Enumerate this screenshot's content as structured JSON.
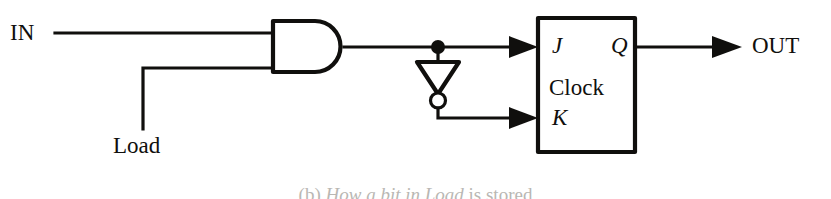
{
  "figure": {
    "background_color": "#ffffff",
    "ink_color": "#100f0d",
    "width": 831,
    "height": 199
  },
  "labels": {
    "input_in": "IN",
    "input_load": "Load",
    "output_out": "OUT",
    "pin_j": "J",
    "pin_q": "Q",
    "pin_k": "K",
    "pin_clock": "Clock"
  },
  "caption": {
    "prefix": "(b) ",
    "text_italic": "How a bit in Load",
    "suffix": " is stored",
    "full": "(b) How a bit in Load is stored",
    "clipped": true
  },
  "components": [
    {
      "id": "and-gate",
      "type": "and-gate",
      "name": "AND gate",
      "inputs": [
        "IN",
        "Load"
      ],
      "output": "gate-out"
    },
    {
      "id": "inverter",
      "type": "inverter",
      "name": "Inverter (NOT gate)",
      "orientation": "down",
      "has_bubble": true
    },
    {
      "id": "flip-flop",
      "type": "jk-flip-flop",
      "name": "JK flip-flop",
      "pins_left": [
        "J",
        "Clock",
        "K"
      ],
      "pins_right": [
        "Q"
      ]
    }
  ],
  "nets": [
    {
      "from": "IN",
      "to": "and-gate.input-a"
    },
    {
      "from": "Load",
      "to": "and-gate.input-b"
    },
    {
      "from": "and-gate.output",
      "to": "flip-flop.J"
    },
    {
      "from": "junction",
      "to": "inverter.input"
    },
    {
      "from": "inverter.output",
      "to": "flip-flop.K"
    },
    {
      "from": "flip-flop.Q",
      "to": "OUT"
    }
  ]
}
